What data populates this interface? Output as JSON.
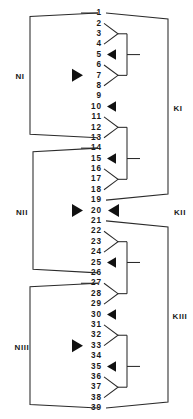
{
  "diagram": {
    "type": "tree-diagram",
    "node_numbers": [
      "1",
      "2",
      "3",
      "4",
      "5",
      "6",
      "7",
      "8",
      "9",
      "10",
      "11",
      "12",
      "13",
      "14",
      "15",
      "16",
      "17",
      "18",
      "19",
      "20",
      "21",
      "22",
      "23",
      "24",
      "25",
      "26",
      "27",
      "28",
      "29",
      "30",
      "31",
      "32",
      "33",
      "34",
      "35",
      "36",
      "37",
      "38",
      "39"
    ],
    "left_groups": [
      {
        "label": "NI",
        "first_node": "1",
        "last_node": "13",
        "marker_node": "7"
      },
      {
        "label": "NII",
        "first_node": "14",
        "last_node": "26",
        "marker_node": "20"
      },
      {
        "label": "NIII",
        "first_node": "27",
        "last_node": "39",
        "marker_node": "33"
      }
    ],
    "right_groups": [
      {
        "label": "KI",
        "first_node": "1",
        "last_node": "19",
        "marker_node": "10"
      },
      {
        "label": "KII",
        "first_node": "20",
        "last_node": "20",
        "marker_node": "20"
      },
      {
        "label": "KIII",
        "first_node": "21",
        "last_node": "39",
        "marker_node": "30"
      }
    ],
    "right_subgroups": [
      {
        "top_node": "2",
        "bottom_node": "4",
        "apex_node": "3",
        "join_node": "5"
      },
      {
        "top_node": "6",
        "bottom_node": "8",
        "apex_node": "7",
        "join_node": "5"
      },
      {
        "top_node": "11",
        "bottom_node": "13",
        "apex_node": "12",
        "join_node": "15"
      },
      {
        "top_node": "16",
        "bottom_node": "18",
        "apex_node": "17",
        "join_node": "15"
      },
      {
        "top_node": "22",
        "bottom_node": "24",
        "apex_node": "23",
        "join_node": "25"
      },
      {
        "top_node": "27",
        "bottom_node": "29",
        "apex_node": "28",
        "join_node": "25"
      },
      {
        "top_node": "31",
        "bottom_node": "33",
        "apex_node": "32",
        "join_node": "35"
      },
      {
        "top_node": "36",
        "bottom_node": "38",
        "apex_node": "37",
        "join_node": "35"
      }
    ],
    "left_markers": [
      "7",
      "20",
      "33"
    ],
    "right_markers": [
      "5",
      "10",
      "15",
      "20",
      "25",
      "30",
      "35"
    ],
    "colors": {
      "line": "#2b2b2b",
      "text": "#1a1a1a",
      "marker": "#111111",
      "background": "#ffffff"
    }
  }
}
